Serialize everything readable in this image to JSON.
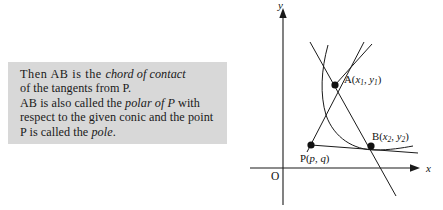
{
  "page": {
    "background": "#ffffff",
    "width": 443,
    "height": 210
  },
  "text_panel": {
    "background": "#d8d8d8",
    "full_text": "Then AB is the chord of contact of the tangents from P. AB is also called the polar of P with respect to the given conic and the point P is called the pole.",
    "lines": [
      {
        "segments": [
          {
            "text": "Then  AB  is the ",
            "style": "roman"
          },
          {
            "text": "chord of contact",
            "style": "italic"
          }
        ]
      },
      {
        "segments": [
          {
            "text": "of the tangents from  P.",
            "style": "roman"
          }
        ]
      },
      {
        "segments": [
          {
            "text": "AB  is also called the ",
            "style": "roman"
          },
          {
            "text": "polar of  P",
            "style": "italic"
          },
          {
            "text": "  with",
            "style": "roman"
          }
        ]
      },
      {
        "segments": [
          {
            "text": "respect to the given conic and the point",
            "style": "roman"
          }
        ]
      },
      {
        "segments": [
          {
            "text": "P  is called the ",
            "style": "roman"
          },
          {
            "text": "pole",
            "style": "italic"
          },
          {
            "text": ".",
            "style": "roman"
          }
        ]
      }
    ]
  },
  "diagram": {
    "stroke_color": "#1a1a1a",
    "axes": {
      "y_label": "y",
      "x_label": "x",
      "origin_label": "O",
      "y_axis": {
        "x": 33,
        "top": 12,
        "bottom": 205
      },
      "x_axis": {
        "y": 168,
        "left": 0,
        "right": 171
      }
    },
    "points": [
      {
        "id": "A",
        "name": "A",
        "coord_text": "A(x₁, y₁)",
        "label_main": "A(",
        "var1": "x",
        "sub1": "1",
        "sep": ", ",
        "var2": "y",
        "sub2": "1",
        "close": ")",
        "px": 85,
        "py": 85,
        "label_x": 95,
        "label_y": 82
      },
      {
        "id": "B",
        "name": "B",
        "coord_text": "B(x₂, y₂)",
        "label_main": "B(",
        "var1": "x",
        "sub1": "2",
        "sep": ", ",
        "var2": "y",
        "sub2": "2",
        "close": ")",
        "px": 121,
        "py": 146,
        "label_x": 122,
        "label_y": 140
      },
      {
        "id": "P",
        "name": "P",
        "coord_text": "P(p, q)",
        "label_main": "P(",
        "var1": "p",
        "sub1": "",
        "sep": ", ",
        "var2": "q",
        "sub2": "",
        "close": ")",
        "px": 61,
        "py": 145,
        "label_x": 52,
        "label_y": 163
      }
    ],
    "curve": {
      "name": "conic",
      "description": "parabola-like conic arc through A and B"
    },
    "lines": [
      {
        "name": "tangent-at-A",
        "from": "top-left",
        "to": "below-B"
      },
      {
        "name": "tangent-at-B",
        "from": "top-right",
        "to": "P-and-beyond"
      },
      {
        "name": "chord-of-contact-AB",
        "from": "A",
        "to": "B"
      },
      {
        "name": "polar-line",
        "from": "P",
        "through": "B"
      }
    ]
  }
}
